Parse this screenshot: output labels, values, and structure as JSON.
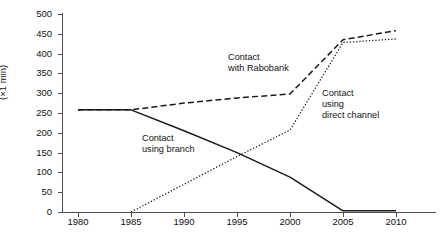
{
  "chart_data": {
    "type": "line",
    "title": "",
    "xlabel": "",
    "ylabel": "(×1 min)",
    "x": [
      1980,
      1985,
      1990,
      1995,
      2000,
      2005,
      2010
    ],
    "xtick_labels": [
      "1980",
      "1985",
      "1990",
      "1995",
      "2000",
      "2005",
      "2010"
    ],
    "ytick_labels": [
      "0",
      "50",
      "100",
      "150",
      "200",
      "250",
      "300",
      "350",
      "400",
      "450",
      "500"
    ],
    "ytick_values": [
      0,
      50,
      100,
      150,
      200,
      250,
      300,
      350,
      400,
      450,
      500
    ],
    "xlim": [
      1980,
      2010
    ],
    "ylim": [
      0,
      500
    ],
    "grid": false,
    "legend_position": "inline-annotations",
    "series": [
      {
        "name": "Contact using branch",
        "style": "solid",
        "color": "#1a1a1a",
        "values": [
          258,
          258,
          205,
          150,
          88,
          3,
          3
        ]
      },
      {
        "name": "Contact with Rabobank",
        "style": "dashed",
        "color": "#1a1a1a",
        "values": [
          258,
          258,
          275,
          288,
          298,
          435,
          458
        ]
      },
      {
        "name": "Contact using direct channel",
        "style": "dotted",
        "color": "#1a1a1a",
        "values": [
          null,
          0,
          70,
          140,
          207,
          428,
          437
        ]
      }
    ],
    "annotations": [
      {
        "id": "rabobank",
        "line1": "Contact",
        "line2": "with Rabobank",
        "text": "Contact\nwith Rabobank"
      },
      {
        "id": "direct",
        "line1": "Contact",
        "line2": "using",
        "line3": "direct channel",
        "text": "Contact\nusing\ndirect channel"
      },
      {
        "id": "branch",
        "line1": "Contact",
        "line2": "using branch",
        "text": "Contact\nusing branch"
      }
    ]
  },
  "axes": {
    "y_title": "(×1 min)"
  },
  "colors": {
    "axis": "#4d4d4d",
    "ink": "#1a1a1a",
    "background": "#ffffff"
  }
}
